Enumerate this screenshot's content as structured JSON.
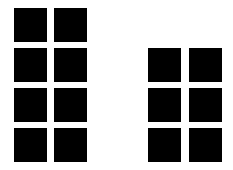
{
  "colors": {
    "background": "#ffffff",
    "square": "#000000"
  },
  "groups": [
    {
      "name": "left-group",
      "columns": 2,
      "rows": 4,
      "count": 8,
      "squares": [
        {
          "x": 14,
          "y": 8
        },
        {
          "x": 54,
          "y": 8
        },
        {
          "x": 14,
          "y": 48
        },
        {
          "x": 54,
          "y": 48
        },
        {
          "x": 14,
          "y": 88
        },
        {
          "x": 54,
          "y": 88
        },
        {
          "x": 14,
          "y": 128
        },
        {
          "x": 54,
          "y": 128
        }
      ]
    },
    {
      "name": "right-group",
      "columns": 2,
      "rows": 3,
      "count": 6,
      "squares": [
        {
          "x": 148,
          "y": 48
        },
        {
          "x": 189,
          "y": 48
        },
        {
          "x": 148,
          "y": 88
        },
        {
          "x": 189,
          "y": 88
        },
        {
          "x": 148,
          "y": 128
        },
        {
          "x": 189,
          "y": 128
        }
      ]
    }
  ]
}
